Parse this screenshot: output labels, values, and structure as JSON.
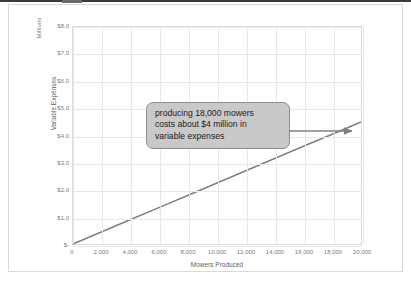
{
  "chart_data": {
    "type": "line",
    "title": "",
    "xlabel": "Mowers Produced",
    "ylabel": "Variable Expenses",
    "y_units_label": "Millions",
    "xlim": [
      0,
      20000
    ],
    "ylim": [
      0,
      8.0
    ],
    "grid": true,
    "legend": "none",
    "x_ticks": [
      "0",
      "2,000",
      "4,000",
      "6,000",
      "8,000",
      "10,000",
      "12,000",
      "14,000",
      "16,000",
      "18,000",
      "20,000"
    ],
    "x_tick_values": [
      0,
      2000,
      4000,
      6000,
      8000,
      10000,
      12000,
      14000,
      16000,
      18000,
      20000
    ],
    "y_ticks": [
      "$-",
      "$1.0",
      "$2.0",
      "$3.0",
      "$4.0",
      "$5.0",
      "$6.0",
      "$7.0",
      "$8.0"
    ],
    "y_tick_values": [
      0,
      1.0,
      2.0,
      3.0,
      4.0,
      5.0,
      6.0,
      7.0,
      8.0
    ],
    "series": [
      {
        "name": "Variable Expenses",
        "color": "#808080",
        "x": [
          0,
          2000,
          4000,
          6000,
          8000,
          10000,
          12000,
          14000,
          16000,
          18000,
          20000
        ],
        "values": [
          0,
          0.45,
          0.9,
          1.35,
          1.8,
          2.25,
          2.7,
          3.15,
          3.6,
          4.05,
          4.5
        ]
      }
    ],
    "annotations": [
      {
        "name": "callout",
        "lines": [
          "producing 18,000 mowers",
          "costs about $4 million in",
          "variable expenses"
        ],
        "arrow_points_to_x": 18000,
        "arrow_points_to_y": 4.0,
        "box_color": "#c9c9c9",
        "border_color": "#8f8f8f",
        "text_color": "#1c1c1c"
      }
    ]
  }
}
